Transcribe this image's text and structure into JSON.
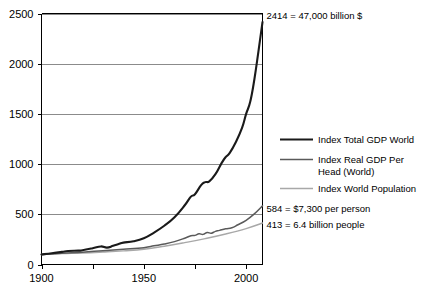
{
  "chart_data": {
    "type": "line",
    "title": "",
    "subtitle": "",
    "xlabel": "",
    "ylabel": "",
    "xlim": [
      1900,
      2008
    ],
    "ylim": [
      0,
      2500
    ],
    "grid": true,
    "legend_position": "right",
    "y_ticks": [
      0,
      500,
      1000,
      1500,
      2000,
      2500
    ],
    "y_tick_labels": [
      "0",
      "500",
      "1000",
      "1500",
      "2000",
      "2500"
    ],
    "x_ticks": [
      1900,
      1925,
      1950,
      1975,
      2000
    ],
    "x_tick_labels": [
      "1900",
      "",
      "1950",
      "",
      "2000"
    ],
    "x_major_labels": [
      "1900",
      "1950",
      "2000"
    ],
    "series": [
      {
        "name": "Index Total GDP World",
        "color": "#1a1a1a",
        "width": 2.1,
        "end_value": 2414,
        "x": [
          1900,
          1905,
          1910,
          1913,
          1918,
          1920,
          1925,
          1929,
          1932,
          1935,
          1938,
          1940,
          1945,
          1950,
          1955,
          1960,
          1965,
          1970,
          1973,
          1975,
          1978,
          1980,
          1982,
          1985,
          1988,
          1990,
          1992,
          1995,
          1998,
          2000,
          2002,
          2004,
          2006,
          2008
        ],
        "values": [
          100,
          112,
          126,
          134,
          138,
          142,
          162,
          180,
          168,
          186,
          206,
          218,
          232,
          262,
          318,
          386,
          470,
          590,
          676,
          700,
          790,
          820,
          828,
          900,
          1010,
          1070,
          1112,
          1220,
          1360,
          1500,
          1620,
          1840,
          2120,
          2414
        ]
      },
      {
        "name": "Index Real GDP Per Head (World)",
        "color": "#5a5a5a",
        "width": 1.5,
        "end_value": 584,
        "x": [
          1900,
          1910,
          1920,
          1930,
          1940,
          1950,
          1955,
          1960,
          1965,
          1970,
          1973,
          1975,
          1977,
          1979,
          1981,
          1983,
          1985,
          1987,
          1990,
          1993,
          1996,
          2000,
          2004,
          2008
        ],
        "values": [
          100,
          113,
          122,
          138,
          152,
          168,
          186,
          204,
          228,
          262,
          286,
          290,
          306,
          300,
          318,
          312,
          330,
          340,
          356,
          366,
          396,
          440,
          504,
          584
        ]
      },
      {
        "name": "Index World Population",
        "color": "#a8a8a8",
        "width": 1.4,
        "end_value": 413,
        "x": [
          1900,
          1910,
          1920,
          1930,
          1940,
          1950,
          1960,
          1970,
          1980,
          1990,
          2000,
          2008
        ],
        "values": [
          100,
          108,
          114,
          124,
          136,
          152,
          182,
          218,
          258,
          304,
          358,
          413
        ]
      }
    ],
    "annotations": [
      {
        "id": "gdp-total",
        "text": "2414 = 47,000 billion $",
        "value": 2414
      },
      {
        "id": "gdp-per-head",
        "text": "584 = $7,300 per person",
        "value": 584
      },
      {
        "id": "population",
        "text": "413 = 6.4 billion people",
        "value": 413
      }
    ]
  },
  "legend": {
    "items": [
      {
        "label": "Index Total GDP World",
        "color": "#1a1a1a",
        "width": 2.1
      },
      {
        "label": "Index Real GDP Per",
        "label2": "Head (World)",
        "color": "#5a5a5a",
        "width": 1.5
      },
      {
        "label": "Index World Population",
        "color": "#a8a8a8",
        "width": 1.4
      }
    ]
  }
}
